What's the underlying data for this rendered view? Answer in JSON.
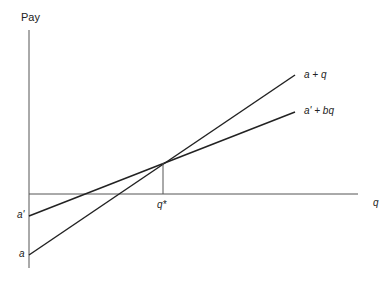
{
  "diagram": {
    "y_axis_label": "Pay",
    "x_axis_label": "q",
    "lines": [
      {
        "label": "a + q",
        "intercept_label": "a"
      },
      {
        "label": "a' + bq",
        "intercept_label": "a'"
      }
    ],
    "intersection_label": "q*",
    "colors": {
      "axis": "#555555",
      "line": "#222222",
      "background": "#ffffff"
    }
  }
}
